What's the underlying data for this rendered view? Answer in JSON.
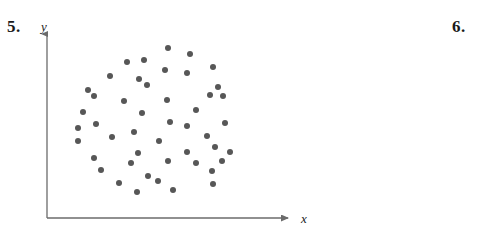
{
  "page": {
    "width": 482,
    "height": 232,
    "background": "#ffffff"
  },
  "problems": {
    "left": {
      "number": "5."
    },
    "right": {
      "number": "6."
    }
  },
  "axes": {
    "x_label": "x",
    "y_label": "y",
    "color": "#6b6b6b",
    "origin": {
      "x": 47,
      "y": 218
    },
    "x_end": {
      "x": 295,
      "y": 218
    },
    "y_end": {
      "x": 47,
      "y": 28
    }
  },
  "chart_data": {
    "type": "scatter",
    "title": "",
    "xlabel": "x",
    "ylabel": "y",
    "grid": false,
    "legend": null,
    "marker": {
      "shape": "circle",
      "diameter_px": 6,
      "color": "#575757"
    },
    "annotation": "Random circular cloud of points showing no correlation between x and y",
    "n_points": 47,
    "axis_pixel_ranges": {
      "x": [
        47,
        295
      ],
      "y": [
        218,
        28
      ]
    },
    "points_px": [
      [
        127,
        62
      ],
      [
        144,
        60
      ],
      [
        168,
        48
      ],
      [
        190,
        54
      ],
      [
        110,
        76
      ],
      [
        139,
        79
      ],
      [
        165,
        70
      ],
      [
        187,
        73
      ],
      [
        213,
        67
      ],
      [
        88,
        90
      ],
      [
        94,
        96
      ],
      [
        147,
        85
      ],
      [
        218,
        87
      ],
      [
        210,
        95
      ],
      [
        223,
        96
      ],
      [
        124,
        101
      ],
      [
        167,
        100
      ],
      [
        83,
        112
      ],
      [
        142,
        113
      ],
      [
        196,
        110
      ],
      [
        96,
        124
      ],
      [
        170,
        122
      ],
      [
        187,
        126
      ],
      [
        225,
        123
      ],
      [
        78,
        128
      ],
      [
        78,
        141
      ],
      [
        134,
        132
      ],
      [
        112,
        137
      ],
      [
        159,
        141
      ],
      [
        207,
        136
      ],
      [
        138,
        153
      ],
      [
        215,
        147
      ],
      [
        230,
        152
      ],
      [
        94,
        158
      ],
      [
        187,
        152
      ],
      [
        222,
        161
      ],
      [
        101,
        170
      ],
      [
        131,
        163
      ],
      [
        168,
        161
      ],
      [
        196,
        163
      ],
      [
        148,
        176
      ],
      [
        212,
        171
      ],
      [
        119,
        183
      ],
      [
        158,
        181
      ],
      [
        213,
        184
      ],
      [
        137,
        192
      ],
      [
        173,
        190
      ]
    ]
  }
}
